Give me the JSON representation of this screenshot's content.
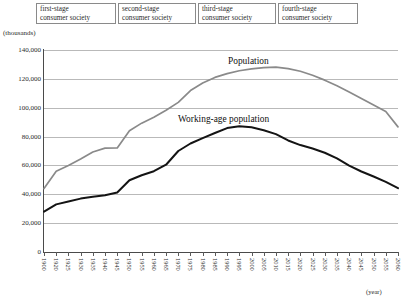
{
  "stages": [
    {
      "name": "first-stage-consumer-society",
      "line1": "first-stage",
      "line2": "consumer society"
    },
    {
      "name": "second-stage-consumer-society",
      "line1": "second-stage",
      "line2": "consumer society"
    },
    {
      "name": "third-stage-consumer-society",
      "line1": "third-stage",
      "line2": "consumer society"
    },
    {
      "name": "fourth-stage-consumer-society",
      "line1": "fourth-stage",
      "line2": "consumer society"
    }
  ],
  "axis": {
    "unit_label": "(thousands)",
    "x_unit_label": "(year)"
  },
  "chart_data": {
    "type": "line",
    "title": "",
    "xlabel": "(year)",
    "ylabel": "(thousands)",
    "ylim": [
      0,
      140000
    ],
    "yticks": [
      0,
      20000,
      40000,
      60000,
      80000,
      100000,
      120000,
      140000
    ],
    "ytick_labels": [
      "0",
      "20,000",
      "40,000",
      "60,000",
      "80,000",
      "100,000",
      "120,000",
      "140,000"
    ],
    "grid": true,
    "legend": "inline-annotations",
    "x": [
      1900,
      1920,
      1925,
      1930,
      1935,
      1940,
      1945,
      1950,
      1955,
      1960,
      1965,
      1970,
      1975,
      1980,
      1985,
      1990,
      1995,
      2000,
      2005,
      2010,
      2015,
      2020,
      2025,
      2030,
      2035,
      2040,
      2045,
      2050,
      2055,
      2060
    ],
    "xtick_labels": [
      "1900",
      "1920",
      "1925",
      "1930",
      "1935",
      "1940",
      "1945",
      "1950",
      "1955",
      "1960",
      "1965",
      "1970",
      "1975",
      "1980",
      "1985",
      "1990",
      "1995",
      "2000",
      "2005",
      "2010",
      "2015",
      "2020",
      "2025",
      "2030",
      "2035",
      "2040",
      "2045",
      "2050",
      "2055",
      "2060"
    ],
    "series": [
      {
        "name": "Population",
        "color": "#8a8a8a",
        "values": [
          44000,
          56000,
          60000,
          64500,
          69300,
          72000,
          72100,
          84000,
          89300,
          93400,
          98300,
          103700,
          111900,
          117100,
          121000,
          123600,
          125600,
          126900,
          127800,
          128100,
          127100,
          125300,
          122500,
          119100,
          115200,
          110900,
          106400,
          101900,
          97400,
          86700
        ]
      },
      {
        "name": "Working-age population",
        "color": "#141414",
        "values": [
          28000,
          33000,
          35000,
          37000,
          38300,
          39400,
          41200,
          49700,
          53200,
          56000,
          60500,
          70000,
          75200,
          78900,
          82500,
          85900,
          87200,
          86400,
          84400,
          81700,
          77300,
          74100,
          71700,
          68800,
          64900,
          59800,
          55800,
          52300,
          48600,
          44200
        ]
      }
    ],
    "annotations": [
      {
        "text": "Population",
        "x": 2005,
        "y": 132000
      },
      {
        "text": "Working-age population",
        "x": 1975,
        "y": 95000
      }
    ]
  }
}
